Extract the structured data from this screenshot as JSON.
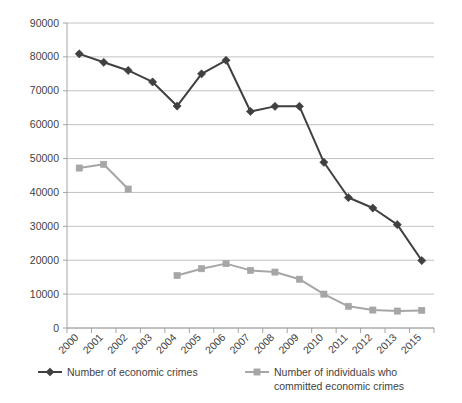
{
  "chart_data": {
    "type": "line",
    "title": "",
    "xlabel": "",
    "ylabel": "",
    "grid": true,
    "legend_position": "bottom",
    "ylim": [
      0,
      90000
    ],
    "ytick_step": 10000,
    "yticks": [
      "0",
      "10000",
      "20000",
      "30000",
      "40000",
      "50000",
      "60000",
      "70000",
      "80000",
      "90000"
    ],
    "categories": [
      "2000",
      "2001",
      "2002",
      "2003",
      "2004",
      "2005",
      "2006",
      "2007",
      "2008",
      "2009",
      "2010",
      "2011",
      "2012",
      "2013",
      "2015"
    ],
    "series": [
      {
        "name": "Number of economic crimes",
        "color": "#404040",
        "marker": "diamond",
        "values": [
          80900,
          78400,
          76000,
          72600,
          65500,
          75000,
          79000,
          63900,
          65400,
          65400,
          48900,
          38500,
          35400,
          30500,
          19900
        ]
      },
      {
        "name": "Number of individuals who committed economic crimes",
        "color": "#a6a6a6",
        "marker": "square",
        "values": [
          47200,
          48300,
          41000,
          null,
          15500,
          17500,
          19000,
          17000,
          16500,
          14400,
          10000,
          6400,
          5300,
          5000,
          5200
        ]
      }
    ]
  },
  "legend": {
    "entries": [
      {
        "label": "Number of economic crimes",
        "color": "#404040",
        "marker": "diamond"
      },
      {
        "label": "Number of individuals who",
        "label2": "committed economic crimes",
        "color": "#a6a6a6",
        "marker": "square"
      }
    ]
  }
}
